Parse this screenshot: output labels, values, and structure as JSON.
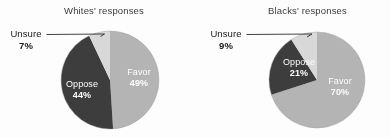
{
  "figure": {
    "background_color": "#ffffff",
    "width": 391,
    "height": 138
  },
  "palette": {
    "favor": "#b5b5b5",
    "oppose": "#3c3c3c",
    "unsure": "#d9d9d9",
    "inside_label_color": "#ffffff",
    "outside_label_color": "#1a1a1a",
    "title_color": "#3a3a3a",
    "leader_line_color": "#2b2b2b"
  },
  "charts": {
    "whites": {
      "title": "Whites' responses",
      "favor": {
        "label": "Favor",
        "pct": "49%"
      },
      "oppose": {
        "label": "Oppose",
        "pct": "44%"
      },
      "unsure": {
        "label": "Unsure",
        "pct": "7%"
      }
    },
    "blacks": {
      "title": "Blacks' responses",
      "favor": {
        "label": "Favor",
        "pct": "70%"
      },
      "oppose": {
        "label": "Oppose",
        "pct": "21%"
      },
      "unsure": {
        "label": "Unsure",
        "pct": "9%"
      }
    }
  },
  "chart_data": [
    {
      "type": "pie",
      "title": "Whites' responses",
      "categories": [
        "Favor",
        "Oppose",
        "Unsure"
      ],
      "values": [
        49,
        44,
        7
      ],
      "unit": "percent",
      "colors": [
        "#b5b5b5",
        "#3c3c3c",
        "#d9d9d9"
      ],
      "start_angle_deg": 0,
      "direction": "clockwise",
      "data_labels": [
        "49%",
        "44%",
        "7%"
      ],
      "label_placement": [
        "inside",
        "inside",
        "outside-leader"
      ],
      "legend": "none",
      "grid": false
    },
    {
      "type": "pie",
      "title": "Blacks' responses",
      "categories": [
        "Favor",
        "Oppose",
        "Unsure"
      ],
      "values": [
        70,
        21,
        9
      ],
      "unit": "percent",
      "colors": [
        "#b5b5b5",
        "#3c3c3c",
        "#d9d9d9"
      ],
      "start_angle_deg": 0,
      "direction": "clockwise",
      "data_labels": [
        "70%",
        "21%",
        "9%"
      ],
      "label_placement": [
        "inside",
        "inside",
        "outside-leader"
      ],
      "legend": "none",
      "grid": false
    }
  ]
}
